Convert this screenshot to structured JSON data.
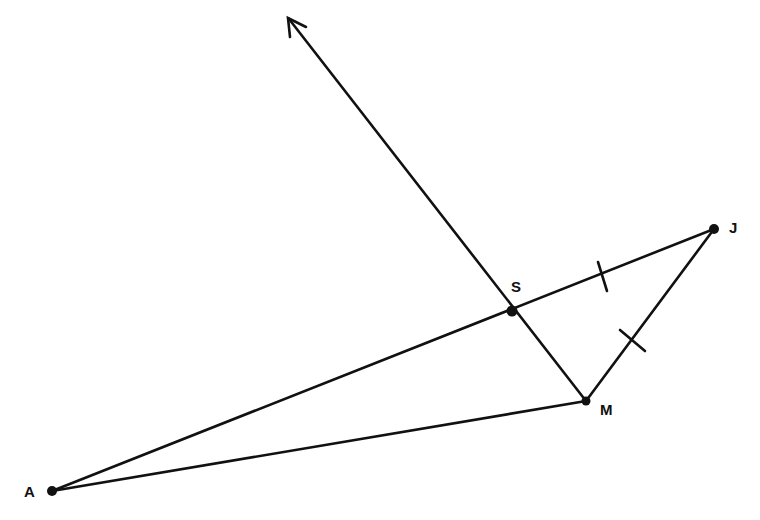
{
  "diagram": {
    "points": [
      {
        "name": "A",
        "label": "A",
        "x": 52,
        "y": 491
      },
      {
        "name": "S",
        "label": "S",
        "x": 512,
        "y": 311
      },
      {
        "name": "J",
        "label": "J",
        "x": 714,
        "y": 229
      },
      {
        "name": "M",
        "label": "M",
        "x": 586,
        "y": 401
      }
    ],
    "segments": [
      [
        "A",
        "J"
      ],
      [
        "A",
        "M"
      ],
      [
        "M",
        "J"
      ],
      [
        "M",
        "S"
      ]
    ],
    "ray": {
      "from": "M",
      "through": "S",
      "tip": {
        "x": 288,
        "y": 18
      }
    },
    "congruence_marks": [
      "SJ",
      "MJ"
    ],
    "line_color": "#111111"
  }
}
